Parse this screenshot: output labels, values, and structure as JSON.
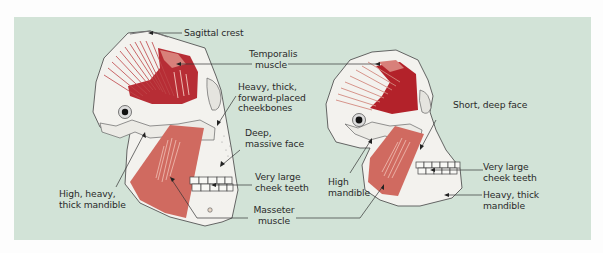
{
  "figure": {
    "background_color": "#d2e3d7",
    "bone_color": "#f3f2ee",
    "muscle_dark_color": "#b3222a",
    "muscle_light_color": "#d27468",
    "left_skull": {
      "labels": {
        "sagittal_crest": "Sagittal crest",
        "cheekbones": "Heavy, thick,\nforward-placed\ncheekbones",
        "face": "Deep,\nmassive face",
        "teeth": "Very large\ncheek teeth",
        "mandible": "High, heavy,\nthick mandible"
      }
    },
    "shared_labels": {
      "temporalis": "Temporalis\nmuscle",
      "masseter": "Masseter\nmuscle"
    },
    "right_skull": {
      "labels": {
        "face": "Short, deep face",
        "mandible_high": "High\nmandible",
        "teeth": "Very large\ncheek teeth",
        "mandible_heavy": "Heavy, thick\nmandible"
      }
    }
  }
}
